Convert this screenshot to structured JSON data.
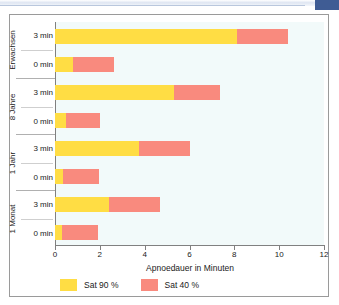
{
  "figure": {
    "background_color": "#f2fafa",
    "border_color": "#9a9a9a"
  },
  "chart_data": {
    "type": "bar",
    "orientation": "horizontal",
    "stacked": true,
    "title": "",
    "xlabel": "Apnoedauer in Minuten",
    "ylabel": "",
    "xlim": [
      0,
      12
    ],
    "xticks": [
      0,
      2,
      4,
      6,
      8,
      10,
      12
    ],
    "xtick_labels": [
      "0",
      "2",
      "4",
      "6",
      "8",
      "10",
      "12"
    ],
    "grid": false,
    "legend_position": "bottom-left",
    "series": [
      {
        "name": "Sat 90 %",
        "color": "#ffdd44",
        "values": [
          8.1,
          0.8,
          5.3,
          0.5,
          3.75,
          0.35,
          2.4,
          0.3
        ]
      },
      {
        "name": "Sat 40 %",
        "color": "#f98a7e",
        "values": [
          2.3,
          1.85,
          2.05,
          1.5,
          2.25,
          1.6,
          2.3,
          1.6
        ]
      }
    ],
    "categories": [
      "Erwachsen 3 min",
      "Erwachsen 0 min",
      "8 Jahre 3 min",
      "8 Jahre 0 min",
      "1 Jahr 3 min",
      "1 Jahr 0 min",
      "1 Monat 3 min",
      "1 Monat 0 min"
    ],
    "groups": [
      {
        "name": "Erwachsen",
        "rows": [
          {
            "label": "3 min",
            "sat90": 8.1,
            "sat40": 2.3,
            "total": 10.4
          },
          {
            "label": "0 min",
            "sat90": 0.8,
            "sat40": 1.85,
            "total": 2.65
          }
        ]
      },
      {
        "name": "8 Jahre",
        "rows": [
          {
            "label": "3 min",
            "sat90": 5.3,
            "sat40": 2.05,
            "total": 7.35
          },
          {
            "label": "0 min",
            "sat90": 0.5,
            "sat40": 1.5,
            "total": 2.0
          }
        ]
      },
      {
        "name": "1 Jahr",
        "rows": [
          {
            "label": "3 min",
            "sat90": 3.75,
            "sat40": 2.25,
            "total": 6.0
          },
          {
            "label": "0 min",
            "sat90": 0.35,
            "sat40": 1.6,
            "total": 1.95
          }
        ]
      },
      {
        "name": "1 Monat",
        "rows": [
          {
            "label": "3 min",
            "sat90": 2.4,
            "sat40": 2.3,
            "total": 4.7
          },
          {
            "label": "0 min",
            "sat90": 0.3,
            "sat40": 1.6,
            "total": 1.9
          }
        ]
      }
    ]
  },
  "legend": {
    "items": [
      {
        "label": "Sat 90 %",
        "color": "#ffdd44"
      },
      {
        "label": "Sat 40 %",
        "color": "#f98a7e"
      }
    ]
  },
  "colors": {
    "sat90": "#ffdd44",
    "sat40": "#f98a7e",
    "plot_bg": "#f2fafa",
    "axis": "#808080",
    "corner_tab": "#3f5c94"
  }
}
